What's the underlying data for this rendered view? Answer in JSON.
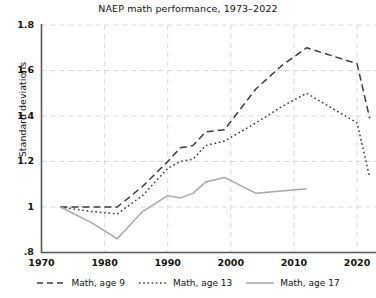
{
  "chart_data": {
    "type": "line",
    "title": "NAEP math performance, 1973–2022",
    "xlabel": "",
    "ylabel": "Standard deviations",
    "xlim": [
      1970,
      2023
    ],
    "ylim": [
      0.8,
      1.8
    ],
    "xticks": [
      1970,
      1980,
      1990,
      2000,
      2010,
      2020
    ],
    "xtick_labels": [
      "1970",
      "1980",
      "1990",
      "2000",
      "2010",
      "2020"
    ],
    "yticks": [
      0.8,
      1.0,
      1.2,
      1.4,
      1.6,
      1.8
    ],
    "ytick_labels": [
      ".8",
      "1",
      "1.2",
      "1.4",
      "1.6",
      "1.8"
    ],
    "grid": true,
    "legend_position": "below",
    "series": [
      {
        "name": "Math, age 9",
        "style": "dashed",
        "color": "#3c3c3c",
        "x": [
          1973,
          1978,
          1982,
          1986,
          1990,
          1992,
          1994,
          1996,
          1999,
          2004,
          2008,
          2012,
          2020,
          2022
        ],
        "y": [
          1.0,
          1.0,
          1.0,
          1.09,
          1.2,
          1.26,
          1.27,
          1.33,
          1.34,
          1.52,
          1.62,
          1.7,
          1.63,
          1.39
        ]
      },
      {
        "name": "Math, age 13",
        "style": "dotted",
        "color": "#3c3c3c",
        "x": [
          1973,
          1978,
          1982,
          1986,
          1990,
          1992,
          1994,
          1996,
          1999,
          2004,
          2008,
          2012,
          2020,
          2022
        ],
        "y": [
          1.0,
          0.98,
          0.97,
          1.05,
          1.17,
          1.2,
          1.21,
          1.27,
          1.29,
          1.37,
          1.44,
          1.5,
          1.37,
          1.13
        ]
      },
      {
        "name": "Math, age 17",
        "style": "solid",
        "color": "#a6a6a6",
        "x": [
          1973,
          1978,
          1982,
          1986,
          1990,
          1992,
          1994,
          1996,
          1999,
          2004,
          2008,
          2012
        ],
        "y": [
          1.0,
          0.93,
          0.86,
          0.98,
          1.05,
          1.04,
          1.06,
          1.11,
          1.13,
          1.06,
          1.07,
          1.08
        ]
      }
    ]
  },
  "legend": {
    "entries": [
      {
        "label": "Math, age 9"
      },
      {
        "label": "Math, age 13"
      },
      {
        "label": "Math, age 17"
      }
    ]
  }
}
